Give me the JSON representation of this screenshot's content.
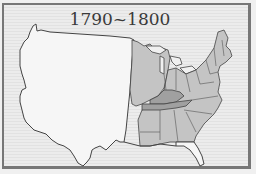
{
  "map": {
    "title": "1790~1800",
    "subject": "United States territory",
    "legend": [],
    "colors": {
      "background": "#ececec",
      "frame": "#777777",
      "unsettled_territory": "#f6f6f6",
      "states": "#c4c4c4",
      "new_states": "#a0a0a0",
      "border": "#444444"
    },
    "regions": [
      {
        "name": "western-territory",
        "shade": "unsettled_territory"
      },
      {
        "name": "northwest-territory",
        "shade": "states"
      },
      {
        "name": "original-states",
        "shade": "states"
      },
      {
        "name": "kentucky",
        "shade": "new_states"
      },
      {
        "name": "tennessee",
        "shade": "new_states"
      }
    ]
  }
}
